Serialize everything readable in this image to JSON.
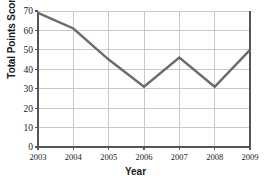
{
  "chart_data": {
    "type": "line",
    "title": "",
    "xlabel": "Year",
    "ylabel": "Total Points Scored",
    "categories": [
      "2003",
      "2004",
      "2005",
      "2006",
      "2007",
      "2008",
      "2009"
    ],
    "x": [
      2003,
      2004,
      2005,
      2006,
      2007,
      2008,
      2009
    ],
    "values": [
      69,
      61,
      45,
      31,
      46,
      31,
      50
    ],
    "series": [
      {
        "name": "Total Points Scored",
        "values": [
          69,
          61,
          45,
          31,
          46,
          31,
          50
        ]
      }
    ],
    "ylim": [
      0,
      70
    ],
    "xlim": [
      2003,
      2009
    ],
    "yticks": [
      0,
      10,
      20,
      30,
      40,
      50,
      60,
      70
    ],
    "ytick_labels": [
      "0",
      "10",
      "20",
      "30",
      "40",
      "50",
      "60",
      "70"
    ],
    "xticks": [
      2003,
      2004,
      2005,
      2006,
      2007,
      2008,
      2009
    ],
    "xtick_labels": [
      "2003",
      "2004",
      "2005",
      "2006",
      "2007",
      "2008",
      "2009"
    ],
    "grid": true,
    "grid_axis": "both",
    "legend": false,
    "legend_position": "none",
    "markers": false,
    "colors": {
      "line": "#6b6b6b",
      "grid": "#c9c9c9",
      "axis": "#555555",
      "text": "#1a1a1a",
      "background": "#ffffff"
    },
    "line_width": 2.4,
    "annotations": []
  }
}
